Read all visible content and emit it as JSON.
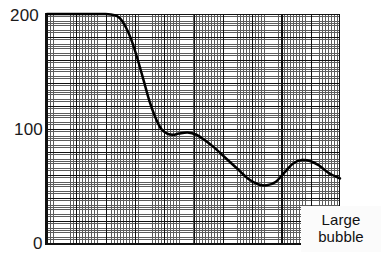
{
  "figure": {
    "background_color": "#ffffff",
    "ink_color": "#000000"
  },
  "axes": {
    "y_ticks": [
      {
        "label": "200",
        "value": 200
      },
      {
        "label": "100",
        "value": 100
      },
      {
        "label": "0",
        "value": 0
      }
    ],
    "x_ticks": [],
    "grid": "graph-paper fine and major grid"
  },
  "annotation": {
    "line1": "Large",
    "line2": "bubble"
  },
  "chart_data": {
    "type": "line",
    "title": "",
    "subtitle": "",
    "xlabel": "",
    "ylabel": "",
    "xlim": [
      0,
      100
    ],
    "ylim": [
      0,
      200
    ],
    "grid": true,
    "legend": false,
    "annotations": [
      {
        "text": "Large bubble",
        "x": 82,
        "y": 25
      }
    ],
    "series": [
      {
        "name": "curve",
        "x": [
          0,
          5,
          10,
          15,
          20,
          23,
          25,
          27,
          29,
          31,
          33,
          35,
          37,
          39,
          41,
          43,
          45,
          48,
          51,
          54,
          57,
          60,
          63,
          66,
          69,
          72,
          75,
          78,
          81,
          84,
          87,
          90,
          93,
          96,
          100
        ],
        "y": [
          200,
          200,
          200,
          200,
          200,
          199,
          196,
          188,
          176,
          160,
          142,
          124,
          110,
          100,
          96,
          95,
          96,
          97,
          95,
          90,
          84,
          77,
          70,
          63,
          56,
          52,
          51,
          54,
          62,
          70,
          73,
          72,
          68,
          62,
          57
        ]
      }
    ]
  }
}
